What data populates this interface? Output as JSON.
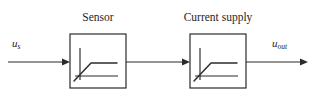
{
  "diagram": {
    "type": "block-diagram",
    "background_color": "#ffffff",
    "line_color": "#2b2b2b",
    "text_color": "#262626",
    "signals": {
      "input": {
        "base": "u",
        "subscript": "s",
        "full": "u_s"
      },
      "output": {
        "base": "u",
        "subscript": "out",
        "full": "u_out"
      }
    },
    "blocks": [
      {
        "id": "sensor",
        "caption": "Sensor",
        "parameter_symbol": "τ",
        "parameter_subscript": "1",
        "parameter_full": "τ₁",
        "icon": "first-order-step-response-curve"
      },
      {
        "id": "current-supply",
        "caption": "Current supply",
        "parameter_symbol": "τ",
        "parameter_subscript": "2",
        "parameter_full": "τ₂",
        "icon": "first-order-step-response-curve"
      }
    ],
    "connections": [
      {
        "from": "input",
        "to": "sensor",
        "arrow": true
      },
      {
        "from": "sensor",
        "to": "current-supply",
        "arrow": true
      },
      {
        "from": "current-supply",
        "to": "output",
        "arrow": true
      }
    ]
  }
}
